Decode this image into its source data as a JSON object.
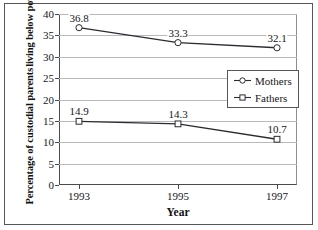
{
  "chart_data": {
    "type": "line",
    "title": "",
    "xlabel": "Year",
    "ylabel": "Percentage of custodial parents living below poverty level",
    "ylabel_lines": [
      "Percentage of custodial parents",
      "living below poverty level"
    ],
    "categories": [
      "1993",
      "1995",
      "1997"
    ],
    "x": [
      1993,
      1995,
      1997
    ],
    "series": [
      {
        "name": "Mothers",
        "marker": "open-circle",
        "values": [
          36.8,
          33.3,
          32.1
        ],
        "labels": [
          "36.8",
          "33.3",
          "32.1"
        ]
      },
      {
        "name": "Fathers",
        "marker": "open-square",
        "values": [
          14.9,
          14.3,
          10.7
        ],
        "labels": [
          "14.9",
          "14.3",
          "10.7"
        ]
      }
    ],
    "ylim": [
      0,
      40
    ],
    "ytick_values": [
      0,
      5,
      10,
      15,
      20,
      25,
      30,
      35,
      40
    ],
    "ytick_labels": [
      "0",
      "5",
      "10",
      "15",
      "20",
      "25",
      "30",
      "35",
      "40"
    ],
    "grid": true,
    "grid_axis": "y",
    "legend_position": "center-right",
    "colors": {
      "line": "#2b2b31",
      "grid": "#b9b9bd",
      "axis": "#4a4a50",
      "frame": "#55555c",
      "text": "#16161a",
      "background": "#ffffff",
      "marker_fill": "#ffffff"
    }
  }
}
